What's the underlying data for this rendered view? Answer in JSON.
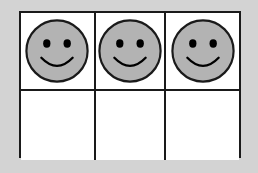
{
  "worksheet": {
    "title": "Ten-frame counting grid",
    "background_color": "#d3d3d3",
    "grid": {
      "columns": 3,
      "rows": 2,
      "cell_fill_color": "#ffffff",
      "border_color": "#1a1a1a",
      "total_cells": 6,
      "filled_cells": 3,
      "empty_cells": 3
    },
    "counter": {
      "shape": "circle",
      "fill_color": "#b3b3b3",
      "outline_color": "#1a1a1a",
      "face": "smiley",
      "eye_color": "#000000",
      "mouth": "smile-arc"
    },
    "cells": [
      {
        "position": "row1-col1",
        "content": "smiley-face-counter",
        "occupied": "true"
      },
      {
        "position": "row1-col2",
        "content": "smiley-face-counter",
        "occupied": "true"
      },
      {
        "position": "row1-col3",
        "content": "smiley-face-counter",
        "occupied": "true"
      },
      {
        "position": "row2-col1",
        "content": "",
        "occupied": "false"
      },
      {
        "position": "row2-col2",
        "content": "",
        "occupied": "false"
      },
      {
        "position": "row2-col3",
        "content": "",
        "occupied": "false"
      }
    ]
  }
}
